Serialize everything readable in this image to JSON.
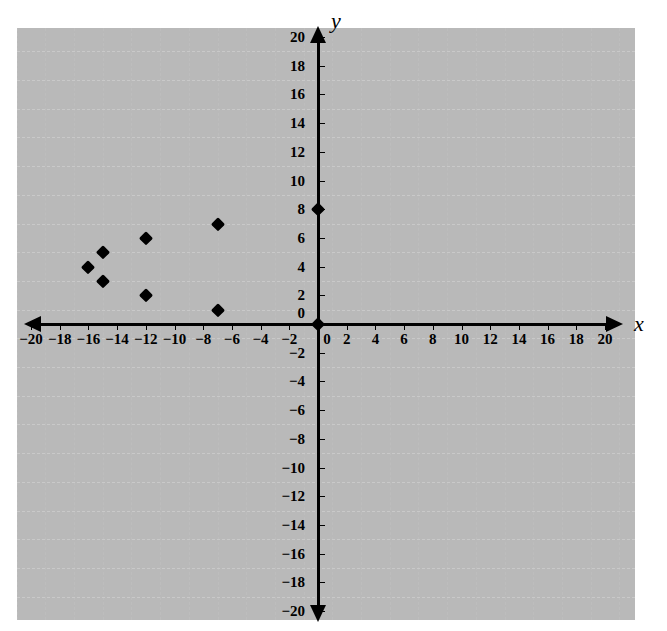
{
  "chart_data": {
    "type": "scatter",
    "title": "",
    "xlabel": "x",
    "ylabel": "y",
    "xlim": [
      -20,
      20
    ],
    "ylim": [
      -20,
      20
    ],
    "x_tick_step": 2,
    "y_tick_step": 2,
    "grid": true,
    "grid_step": 2,
    "legend": null,
    "marker": "diamond",
    "marker_color": "#000000",
    "points": [
      {
        "x": -16,
        "y": 4
      },
      {
        "x": -15,
        "y": 5
      },
      {
        "x": -15,
        "y": 3
      },
      {
        "x": -12,
        "y": 6
      },
      {
        "x": -12,
        "y": 2
      },
      {
        "x": -7,
        "y": 7
      },
      {
        "x": -7,
        "y": 1
      },
      {
        "x": 0,
        "y": 8
      },
      {
        "x": 0,
        "y": 0
      }
    ],
    "x_tick_labels": [
      "-20",
      "-18",
      "-16",
      "-14",
      "-12",
      "-10",
      "-8",
      "-6",
      "-4",
      "-2",
      "0",
      "2",
      "4",
      "6",
      "8",
      "10",
      "12",
      "14",
      "16",
      "18",
      "20"
    ],
    "y_tick_labels": [
      "-20",
      "-18",
      "-16",
      "-14",
      "-12",
      "-10",
      "-8",
      "-6",
      "-4",
      "-2",
      "0",
      "2",
      "4",
      "6",
      "8",
      "10",
      "12",
      "14",
      "16",
      "18",
      "20"
    ]
  },
  "axes": {
    "x_name": "x",
    "y_name": "y"
  },
  "colors": {
    "axis": "#000000",
    "grid": "#c0c0c0",
    "marker": "#000000",
    "background": "#ffffff"
  }
}
